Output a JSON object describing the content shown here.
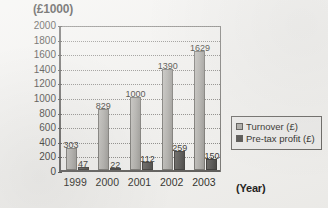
{
  "chart_data": {
    "type": "bar",
    "title": "(£1000)",
    "xlabel": "(Year)",
    "ylabel": "",
    "categories": [
      "1999",
      "2000",
      "2001",
      "2002",
      "2003"
    ],
    "series": [
      {
        "name": "Turnover (£)",
        "values": [
          303,
          829,
          1000,
          1390,
          1629
        ],
        "color": "#a6a49f"
      },
      {
        "name": "Pre-tax profit (£)",
        "values": [
          47,
          22,
          112,
          259,
          150
        ],
        "color": "#454340"
      }
    ],
    "ylim": [
      0,
      2000
    ],
    "ytick_step": 200,
    "yticks": [
      "0",
      "200",
      "400",
      "600",
      "800",
      "1000",
      "1200",
      "1400",
      "1600",
      "1800",
      "2000"
    ],
    "grid": true,
    "legend_position": "bottom-right",
    "data_labels": true
  },
  "legend": {
    "items": [
      {
        "label": "Turnover (£)",
        "swatch": "#a6a49f"
      },
      {
        "label": "Pre-tax profit (£)",
        "swatch": "#454340"
      }
    ]
  }
}
